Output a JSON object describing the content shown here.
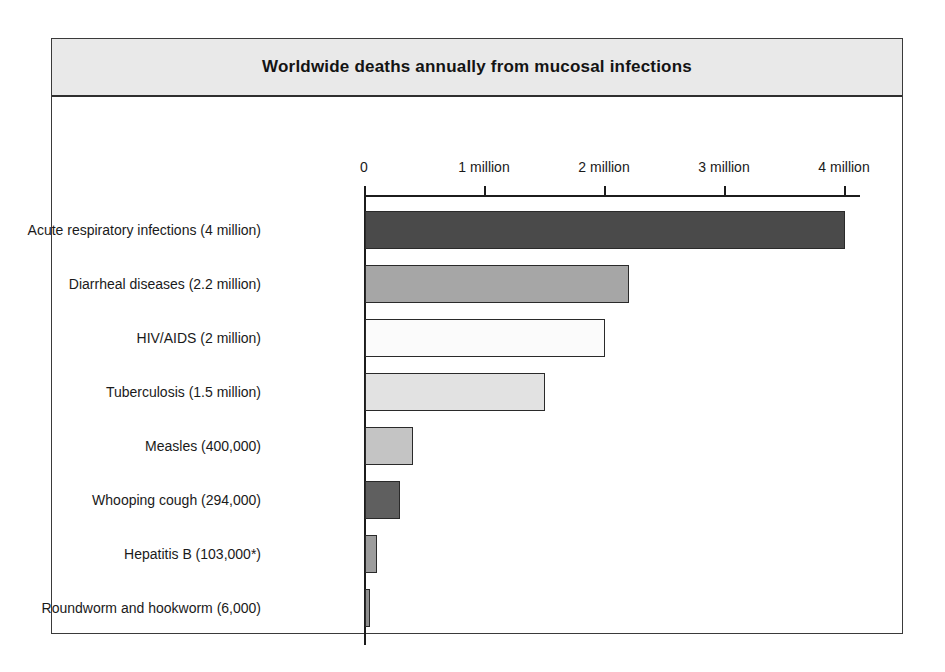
{
  "figure": {
    "title": "Worldwide deaths annually from mucosal infections"
  },
  "chart_data": {
    "type": "bar",
    "orientation": "horizontal",
    "title": "Worldwide deaths annually from mucosal infections",
    "xlabel": "",
    "ylabel": "",
    "xlim": [
      0,
      4.13
    ],
    "grid": false,
    "legend": null,
    "unit": "deaths per year",
    "axis_ticks": [
      {
        "value": 0,
        "label": "0"
      },
      {
        "value": 1,
        "label": "1 million"
      },
      {
        "value": 2,
        "label": "2 million"
      },
      {
        "value": 3,
        "label": "3 million"
      },
      {
        "value": 4,
        "label": "4 million"
      }
    ],
    "categories": [
      "Acute respiratory infections (4 million)",
      "Diarrheal diseases (2.2 million)",
      "HIV/AIDS (2 million)",
      "Tuberculosis (1.5 million)",
      "Measles (400,000)",
      "Whooping cough (294,000)",
      "Hepatitis B (103,000*)",
      "Roundworm and hookworm (6,000)"
    ],
    "values": [
      4.0,
      2.2,
      2.0,
      1.5,
      0.4,
      0.294,
      0.103,
      0.006
    ],
    "bars": [
      {
        "label": "Acute respiratory infections (4 million)",
        "value": 4.0,
        "value_text": "4 million",
        "color": "#4a4a4a"
      },
      {
        "label": "Diarrheal diseases (2.2 million)",
        "value": 2.2,
        "value_text": "2.2 million",
        "color": "#a6a6a6"
      },
      {
        "label": "HIV/AIDS (2 million)",
        "value": 2.0,
        "value_text": "2 million",
        "color": "#fbfbfb"
      },
      {
        "label": "Tuberculosis (1.5 million)",
        "value": 1.5,
        "value_text": "1.5 million",
        "color": "#e2e2e2"
      },
      {
        "label": "Measles (400,000)",
        "value": 0.4,
        "value_text": "400,000",
        "color": "#c4c4c4"
      },
      {
        "label": "Whooping cough (294,000)",
        "value": 0.294,
        "value_text": "294,000",
        "color": "#5f5f5f"
      },
      {
        "label": "Hepatitis B (103,000*)",
        "value": 0.103,
        "value_text": "103,000*",
        "color": "#9c9c9c"
      },
      {
        "label": "Roundworm and hookworm (6,000)",
        "value": 0.006,
        "value_text": "6,000",
        "color": "#8f8f8f"
      }
    ]
  },
  "colors": {
    "frame_border": "#3a3a3a",
    "title_band_background": "#e9e9e9",
    "axis": "#1c1c1c",
    "text": "#1a1a1a"
  }
}
